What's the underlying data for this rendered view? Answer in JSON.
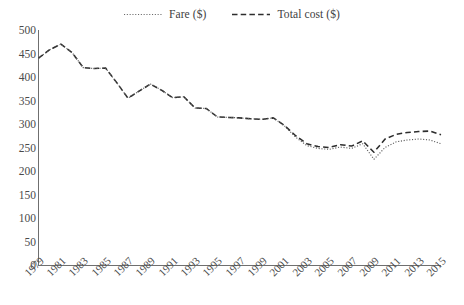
{
  "chart_data": {
    "type": "line",
    "title": "",
    "subtitle": "",
    "xlabel": "",
    "ylabel": "",
    "ylim": [
      0,
      500
    ],
    "ytick_step": 50,
    "yticks": [
      "500",
      "450",
      "400",
      "350",
      "300",
      "250",
      "200",
      "150",
      "100",
      "50",
      "0"
    ],
    "grid": false,
    "legend_position": "top-center",
    "x": [
      1979,
      1980,
      1981,
      1982,
      1983,
      1984,
      1985,
      1986,
      1987,
      1988,
      1989,
      1990,
      1991,
      1992,
      1993,
      1994,
      1995,
      1996,
      1997,
      1998,
      1999,
      2000,
      2001,
      2002,
      2003,
      2004,
      2005,
      2006,
      2007,
      2008,
      2009,
      2010,
      2011,
      2012,
      2013,
      2014,
      2015
    ],
    "xtick_labels": [
      "1979",
      "1981",
      "1983",
      "1985",
      "1987",
      "1989",
      "1991",
      "1993",
      "1995",
      "1997",
      "1999",
      "2001",
      "2003",
      "2005",
      "2007",
      "2009",
      "2011",
      "2013",
      "2015"
    ],
    "series": [
      {
        "name": "Fare ($)",
        "style": "dotted",
        "color": "#5c5c5c",
        "values": [
          440,
          458,
          470,
          452,
          420,
          418,
          419,
          388,
          355,
          370,
          385,
          372,
          356,
          358,
          334,
          333,
          315,
          314,
          313,
          311,
          310,
          313,
          296,
          272,
          254,
          248,
          246,
          251,
          248,
          258,
          225,
          250,
          262,
          266,
          268,
          266,
          258
        ]
      },
      {
        "name": "Total cost ($)",
        "style": "dashed",
        "color": "#2d2d2d",
        "values": [
          440,
          458,
          470,
          452,
          420,
          418,
          419,
          388,
          355,
          370,
          385,
          372,
          356,
          358,
          334,
          333,
          315,
          314,
          313,
          311,
          310,
          313,
          297,
          275,
          258,
          252,
          250,
          256,
          253,
          264,
          240,
          268,
          278,
          282,
          284,
          285,
          277
        ]
      }
    ]
  },
  "legend": {
    "entries": [
      {
        "label": "Fare ($)",
        "style": "dotted"
      },
      {
        "label": "Total cost ($)",
        "style": "dashed"
      }
    ]
  }
}
